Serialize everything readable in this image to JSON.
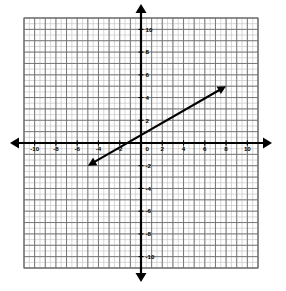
{
  "figure": {
    "name": "coordinate-plane-line-graph",
    "background_color": "#ffffff",
    "grid_color_major": "#6e6e6e",
    "grid_color_minor": "#bdbdbd",
    "axis_color": "#000000",
    "line_color": "#000000",
    "label_color": "#000000"
  },
  "chart_data": {
    "type": "line",
    "title": "",
    "xlabel": "",
    "ylabel": "",
    "xlim": [
      -11,
      11
    ],
    "ylim": [
      -11,
      11
    ],
    "grid": true,
    "grid_major_step": 1,
    "grid_minor_step": 0.5,
    "legend": false,
    "axes": {
      "x_axis_arrows": [
        "left",
        "right"
      ],
      "y_axis_arrows": [
        "up",
        "down"
      ],
      "origin_label": "0"
    },
    "xticks": [
      -10,
      -8,
      -6,
      -4,
      -2,
      0,
      2,
      4,
      6,
      8,
      10
    ],
    "xtick_labels": [
      "-10",
      "-8",
      "-6",
      "-4",
      "-2",
      "0",
      "2",
      "4",
      "6",
      "8",
      "10"
    ],
    "yticks": [
      -10,
      -8,
      -6,
      -4,
      -2,
      2,
      4,
      6,
      8,
      10
    ],
    "ytick_labels": [
      "-10",
      "-8",
      "-6",
      "-4",
      "-2",
      "2",
      "4",
      "6",
      "8",
      "10"
    ],
    "series": [
      {
        "name": "line-1",
        "type": "segment-with-arrows",
        "arrow_start": true,
        "arrow_end": true,
        "x": [
          -5,
          8
        ],
        "y": [
          -2,
          5
        ],
        "slope": 0.538,
        "y_intercept": 1,
        "x_intercept": -1.9,
        "points": [
          {
            "x": -5,
            "y": -2
          },
          {
            "x": 0,
            "y": 1
          },
          {
            "x": 8,
            "y": 5
          }
        ]
      }
    ]
  },
  "tick_labels_x": [
    {
      "value": -10,
      "text": "-10"
    },
    {
      "value": -8,
      "text": "-8"
    },
    {
      "value": -6,
      "text": "-6"
    },
    {
      "value": -4,
      "text": "-4"
    },
    {
      "value": -2,
      "text": "-2"
    },
    {
      "value": 2,
      "text": "2"
    },
    {
      "value": 4,
      "text": "4"
    },
    {
      "value": 6,
      "text": "6"
    },
    {
      "value": 8,
      "text": "8"
    },
    {
      "value": 10,
      "text": "10"
    }
  ],
  "tick_labels_y": [
    {
      "value": 10,
      "text": "10"
    },
    {
      "value": 8,
      "text": "8"
    },
    {
      "value": 6,
      "text": "6"
    },
    {
      "value": 4,
      "text": "4"
    },
    {
      "value": 2,
      "text": "2"
    },
    {
      "value": -2,
      "text": "-2"
    },
    {
      "value": -4,
      "text": "-4"
    },
    {
      "value": -6,
      "text": "-6"
    },
    {
      "value": -8,
      "text": "-8"
    },
    {
      "value": -10,
      "text": "-10"
    }
  ],
  "origin": {
    "text": "0"
  }
}
